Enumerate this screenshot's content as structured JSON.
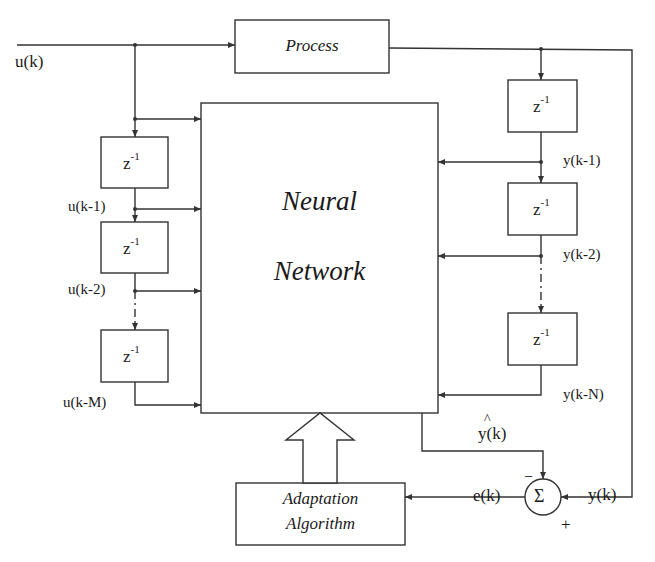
{
  "blocks": {
    "process": "Process",
    "neural_network_line1": "Neural",
    "neural_network_line2": "Network",
    "adaptation_line1": "Adaptation",
    "adaptation_line2": "Algorithm",
    "delay": "z",
    "delay_exponent": "-1",
    "summer": "Σ"
  },
  "signals": {
    "input": "u(k)",
    "input_delays": [
      "u(k-1)",
      "u(k-2)",
      "u(k-M)"
    ],
    "output_delays": [
      "y(k-1)",
      "y(k-2)",
      "y(k-N)"
    ],
    "nn_output": "y(k)",
    "nn_output_hat": "^",
    "plant_output": "y(k)",
    "error": "e(k)",
    "minus_sign": "−",
    "plus_sign": "+"
  },
  "colors": {
    "stroke": "#333333",
    "text": "#1a1a1a",
    "background": "#ffffff"
  }
}
